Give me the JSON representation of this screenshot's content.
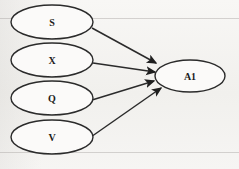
{
  "diagram": {
    "type": "path-diagram",
    "title": "",
    "background_color": "#f4f3f1",
    "stroke_color": "#2b2b2b",
    "text_color": "#1b1b1b",
    "nodes": [
      {
        "id": "S",
        "label": "S",
        "shape": "ellipse",
        "cx": 52,
        "cy": 22,
        "rx": 41,
        "ry": 17,
        "role": "source"
      },
      {
        "id": "X",
        "label": "X",
        "shape": "ellipse",
        "cx": 52,
        "cy": 60,
        "rx": 41,
        "ry": 17,
        "role": "source"
      },
      {
        "id": "Q",
        "label": "Q",
        "shape": "ellipse",
        "cx": 52,
        "cy": 98,
        "rx": 41,
        "ry": 17,
        "role": "source"
      },
      {
        "id": "V",
        "label": "V",
        "shape": "ellipse",
        "cx": 52,
        "cy": 137,
        "rx": 41,
        "ry": 17,
        "role": "source"
      },
      {
        "id": "A1",
        "label": "A1",
        "shape": "ellipse",
        "cx": 190,
        "cy": 76,
        "rx": 35,
        "ry": 16,
        "role": "target"
      }
    ],
    "edges": [
      {
        "id": "S-to-A1",
        "from": "S",
        "to": "A1",
        "label": "",
        "arrowhead": "filled",
        "x1": 92,
        "y1": 28,
        "x2": 156,
        "y2": 63
      },
      {
        "id": "X-to-A1",
        "from": "X",
        "to": "A1",
        "label": "",
        "arrowhead": "filled",
        "x1": 93,
        "y1": 63,
        "x2": 155,
        "y2": 72
      },
      {
        "id": "Q-to-A1",
        "from": "Q",
        "to": "A1",
        "label": "",
        "arrowhead": "filled",
        "x1": 92,
        "y1": 100,
        "x2": 154,
        "y2": 81
      },
      {
        "id": "V-to-A1",
        "from": "V",
        "to": "A1",
        "label": "",
        "arrowhead": "filled",
        "x1": 88,
        "y1": 139,
        "x2": 161,
        "y2": 88
      }
    ],
    "artifacts": {
      "ghost_rule_top": "",
      "ghost_rule_bottom": "",
      "ghost_text_rows": [
        "",
        "",
        ""
      ]
    }
  }
}
